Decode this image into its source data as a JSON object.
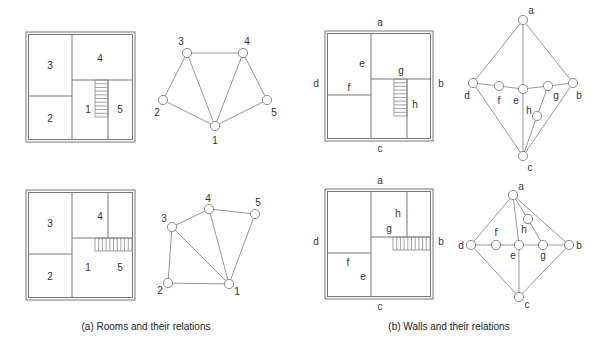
{
  "captions": {
    "rooms": "(a) Rooms and their relations",
    "walls": "(b) Walls and their relations"
  },
  "room_plans": [
    {
      "room_labels": [
        "3",
        "4",
        "2",
        "1",
        "5"
      ]
    },
    {
      "room_labels": [
        "3",
        "4",
        "2",
        "1",
        "5"
      ]
    }
  ],
  "room_graphs": [
    {
      "nodes": [
        "1",
        "2",
        "3",
        "4",
        "5"
      ],
      "edges": [
        [
          "3",
          "4"
        ],
        [
          "3",
          "2"
        ],
        [
          "3",
          "1"
        ],
        [
          "4",
          "1"
        ],
        [
          "4",
          "5"
        ],
        [
          "2",
          "1"
        ],
        [
          "5",
          "1"
        ]
      ]
    },
    {
      "nodes": [
        "1",
        "2",
        "3",
        "4",
        "5"
      ],
      "edges": [
        [
          "3",
          "4"
        ],
        [
          "4",
          "5"
        ],
        [
          "3",
          "2"
        ],
        [
          "3",
          "1"
        ],
        [
          "4",
          "1"
        ],
        [
          "5",
          "1"
        ],
        [
          "2",
          "1"
        ]
      ]
    }
  ],
  "wall_plans": [
    {
      "wall_labels": [
        "a",
        "b",
        "c",
        "d",
        "e",
        "f",
        "g",
        "h"
      ]
    },
    {
      "wall_labels": [
        "a",
        "b",
        "c",
        "d",
        "e",
        "f",
        "g",
        "h"
      ]
    }
  ],
  "wall_graphs": [
    {
      "nodes": [
        "a",
        "b",
        "c",
        "d",
        "e",
        "f",
        "g",
        "h"
      ],
      "edges": [
        [
          "a",
          "d"
        ],
        [
          "a",
          "e"
        ],
        [
          "a",
          "b"
        ],
        [
          "d",
          "f"
        ],
        [
          "f",
          "e"
        ],
        [
          "e",
          "g"
        ],
        [
          "g",
          "b"
        ],
        [
          "d",
          "c"
        ],
        [
          "e",
          "c"
        ],
        [
          "g",
          "h"
        ],
        [
          "h",
          "c"
        ],
        [
          "b",
          "c"
        ]
      ]
    },
    {
      "nodes": [
        "a",
        "b",
        "c",
        "d",
        "e",
        "f",
        "g",
        "h"
      ],
      "edges": [
        [
          "a",
          "d"
        ],
        [
          "a",
          "e"
        ],
        [
          "a",
          "h"
        ],
        [
          "a",
          "b"
        ],
        [
          "h",
          "g"
        ],
        [
          "d",
          "f"
        ],
        [
          "f",
          "e"
        ],
        [
          "e",
          "g"
        ],
        [
          "g",
          "b"
        ],
        [
          "d",
          "c"
        ],
        [
          "e",
          "c"
        ],
        [
          "b",
          "c"
        ]
      ]
    }
  ]
}
